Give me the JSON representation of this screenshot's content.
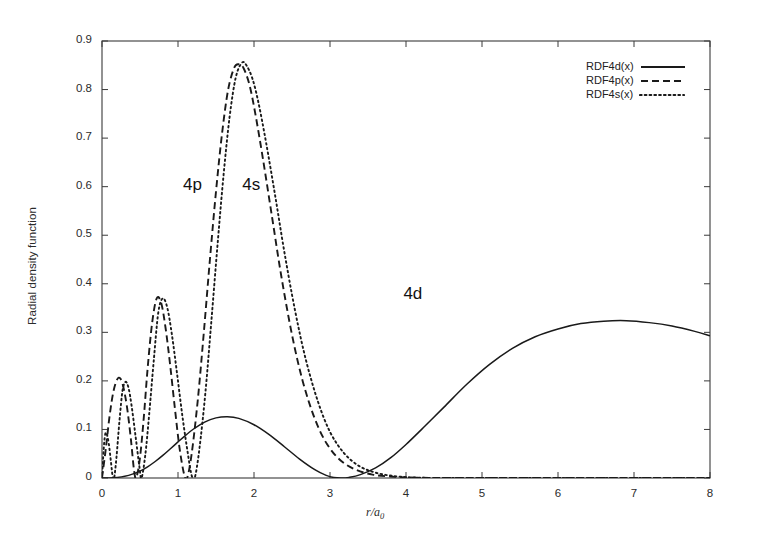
{
  "chart_data": {
    "type": "line",
    "title": "",
    "xlabel": "r/a0",
    "xlabel_main": "r/a",
    "xlabel_sub": "0",
    "ylabel": "Radial density function",
    "xlim": [
      0,
      8
    ],
    "ylim": [
      0,
      0.9
    ],
    "grid": false,
    "legend_position": "top-right",
    "xticks": [
      "0",
      "1",
      "2",
      "3",
      "4",
      "5",
      "6",
      "7",
      "8"
    ],
    "xtick_values": [
      0,
      1,
      2,
      3,
      4,
      5,
      6,
      7,
      8
    ],
    "yticks": [
      "0",
      "0.1",
      "0.2",
      "0.3",
      "0.4",
      "0.5",
      "0.6",
      "0.7",
      "0.8",
      "0.9"
    ],
    "ytick_values": [
      0,
      0.1,
      0.2,
      0.3,
      0.4,
      0.5,
      0.6,
      0.7,
      0.8,
      0.9
    ],
    "annotations": [
      {
        "text": "4p",
        "x": 1.25,
        "y": 0.6
      },
      {
        "text": "4s",
        "x": 2.03,
        "y": 0.6
      },
      {
        "text": "4d",
        "x": 4.15,
        "y": 0.375
      }
    ],
    "series": [
      {
        "name": "RDF4d(x)",
        "label": "RDF4d(x)",
        "style": "solid",
        "color": "#1a1a1a",
        "peaks": [
          {
            "x": 4.2,
            "y": 0.325
          },
          {
            "x": 1.35,
            "y": 0.152
          }
        ],
        "nodes": [
          2.4
        ],
        "points": [
          [
            0.0,
            0.0
          ],
          [
            0.1,
            0.0002
          ],
          [
            0.2,
            0.0012
          ],
          [
            0.3,
            0.0036
          ],
          [
            0.4,
            0.0079
          ],
          [
            0.5,
            0.0143
          ],
          [
            0.6,
            0.0231
          ],
          [
            0.7,
            0.034
          ],
          [
            0.8,
            0.0466
          ],
          [
            0.9,
            0.0603
          ],
          [
            1.0,
            0.0743
          ],
          [
            1.1,
            0.0879
          ],
          [
            1.2,
            0.1004
          ],
          [
            1.35,
            0.1152
          ],
          [
            1.5,
            0.1238
          ],
          [
            1.65,
            0.1262
          ],
          [
            1.8,
            0.1228
          ],
          [
            2.0,
            0.1097
          ],
          [
            2.2,
            0.0892
          ],
          [
            2.4,
            0.0644
          ],
          [
            2.6,
            0.039
          ],
          [
            2.8,
            0.0172
          ],
          [
            2.95,
            0.0053
          ],
          [
            3.05,
            0.001
          ],
          [
            3.15,
            0.0
          ],
          [
            3.25,
            0.0013
          ],
          [
            3.4,
            0.007
          ],
          [
            3.6,
            0.0207
          ],
          [
            3.8,
            0.0418
          ],
          [
            4.0,
            0.069
          ],
          [
            4.25,
            0.107
          ],
          [
            4.5,
            0.146
          ],
          [
            4.8,
            0.193
          ],
          [
            5.1,
            0.234
          ],
          [
            5.4,
            0.267
          ],
          [
            5.7,
            0.291
          ],
          [
            6.0,
            0.307
          ],
          [
            6.3,
            0.318
          ],
          [
            6.6,
            0.323
          ],
          [
            6.9,
            0.324
          ],
          [
            7.2,
            0.32
          ],
          [
            7.5,
            0.313
          ],
          [
            7.8,
            0.302
          ],
          [
            8.0,
            0.293
          ]
        ]
      },
      {
        "name": "RDF4p(x)",
        "label": "RDF4p(x)",
        "style": "dashed",
        "color": "#1a1a1a",
        "peaks": [
          {
            "x": 0.22,
            "y": 0.205
          },
          {
            "x": 0.7,
            "y": 0.372
          },
          {
            "x": 1.8,
            "y": 0.852
          }
        ],
        "nodes": [
          0.42,
          1.08
        ],
        "points": [
          [
            0.0,
            0.0
          ],
          [
            0.05,
            0.06
          ],
          [
            0.1,
            0.128
          ],
          [
            0.15,
            0.178
          ],
          [
            0.2,
            0.203
          ],
          [
            0.24,
            0.205
          ],
          [
            0.28,
            0.188
          ],
          [
            0.33,
            0.145
          ],
          [
            0.38,
            0.08
          ],
          [
            0.42,
            0.018
          ],
          [
            0.45,
            0.0
          ],
          [
            0.5,
            0.042
          ],
          [
            0.55,
            0.125
          ],
          [
            0.6,
            0.225
          ],
          [
            0.66,
            0.32
          ],
          [
            0.72,
            0.37
          ],
          [
            0.78,
            0.36
          ],
          [
            0.84,
            0.305
          ],
          [
            0.9,
            0.228
          ],
          [
            0.96,
            0.142
          ],
          [
            1.02,
            0.062
          ],
          [
            1.08,
            0.008
          ],
          [
            1.12,
            0.0
          ],
          [
            1.18,
            0.05
          ],
          [
            1.26,
            0.16
          ],
          [
            1.34,
            0.3
          ],
          [
            1.42,
            0.45
          ],
          [
            1.5,
            0.59
          ],
          [
            1.58,
            0.71
          ],
          [
            1.66,
            0.8
          ],
          [
            1.74,
            0.845
          ],
          [
            1.8,
            0.852
          ],
          [
            1.86,
            0.845
          ],
          [
            1.94,
            0.81
          ],
          [
            2.02,
            0.748
          ],
          [
            2.12,
            0.655
          ],
          [
            2.24,
            0.535
          ],
          [
            2.36,
            0.415
          ],
          [
            2.5,
            0.295
          ],
          [
            2.64,
            0.2
          ],
          [
            2.8,
            0.122
          ],
          [
            2.96,
            0.07
          ],
          [
            3.14,
            0.036
          ],
          [
            3.34,
            0.017
          ],
          [
            3.56,
            0.007
          ],
          [
            3.8,
            0.003
          ],
          [
            4.06,
            0.001
          ],
          [
            4.4,
            0.0
          ],
          [
            5.0,
            0.0
          ],
          [
            6.0,
            0.0
          ],
          [
            7.0,
            0.0
          ],
          [
            8.0,
            0.0
          ]
        ]
      },
      {
        "name": "RDF4s(x)",
        "label": "RDF4s(x)",
        "style": "dotted",
        "color": "#1a1a1a",
        "peaks": [
          {
            "x": 0.05,
            "y": 0.092
          },
          {
            "x": 0.28,
            "y": 0.198
          },
          {
            "x": 0.76,
            "y": 0.37
          },
          {
            "x": 1.84,
            "y": 0.855
          }
        ],
        "nodes": [
          0.14,
          0.5,
          1.18
        ],
        "points": [
          [
            0.0,
            0.0
          ],
          [
            0.02,
            0.055
          ],
          [
            0.04,
            0.088
          ],
          [
            0.06,
            0.092
          ],
          [
            0.09,
            0.07
          ],
          [
            0.12,
            0.03
          ],
          [
            0.14,
            0.004
          ],
          [
            0.16,
            0.0
          ],
          [
            0.19,
            0.042
          ],
          [
            0.23,
            0.118
          ],
          [
            0.27,
            0.18
          ],
          [
            0.31,
            0.198
          ],
          [
            0.35,
            0.185
          ],
          [
            0.39,
            0.148
          ],
          [
            0.44,
            0.088
          ],
          [
            0.49,
            0.026
          ],
          [
            0.52,
            0.0
          ],
          [
            0.57,
            0.048
          ],
          [
            0.62,
            0.13
          ],
          [
            0.68,
            0.24
          ],
          [
            0.74,
            0.34
          ],
          [
            0.8,
            0.37
          ],
          [
            0.86,
            0.35
          ],
          [
            0.92,
            0.295
          ],
          [
            0.99,
            0.212
          ],
          [
            1.06,
            0.125
          ],
          [
            1.13,
            0.05
          ],
          [
            1.18,
            0.005
          ],
          [
            1.22,
            0.0
          ],
          [
            1.28,
            0.058
          ],
          [
            1.36,
            0.175
          ],
          [
            1.44,
            0.325
          ],
          [
            1.52,
            0.48
          ],
          [
            1.6,
            0.625
          ],
          [
            1.68,
            0.745
          ],
          [
            1.76,
            0.825
          ],
          [
            1.84,
            0.855
          ],
          [
            1.9,
            0.85
          ],
          [
            1.98,
            0.822
          ],
          [
            2.06,
            0.772
          ],
          [
            2.16,
            0.69
          ],
          [
            2.28,
            0.58
          ],
          [
            2.4,
            0.465
          ],
          [
            2.54,
            0.345
          ],
          [
            2.68,
            0.245
          ],
          [
            2.84,
            0.158
          ],
          [
            3.0,
            0.095
          ],
          [
            3.18,
            0.052
          ],
          [
            3.38,
            0.025
          ],
          [
            3.6,
            0.011
          ],
          [
            3.84,
            0.004
          ],
          [
            4.1,
            0.001
          ],
          [
            4.45,
            0.0
          ],
          [
            5.0,
            0.0
          ],
          [
            6.0,
            0.0
          ],
          [
            7.0,
            0.0
          ],
          [
            8.0,
            0.0
          ]
        ]
      }
    ]
  },
  "legend": {
    "entries": [
      {
        "label": "RDF4d(x)",
        "style": "solid"
      },
      {
        "label": "RDF4p(x)",
        "style": "dashed"
      },
      {
        "label": "RDF4s(x)",
        "style": "dotted"
      }
    ]
  }
}
